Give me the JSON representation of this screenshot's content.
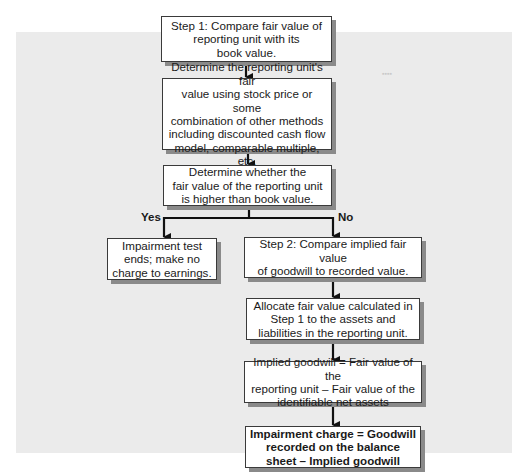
{
  "diagram": {
    "type": "flowchart",
    "nodes": {
      "step1": "Step 1: Compare fair value of\nreporting unit with its\nbook value.",
      "determine_fair_value": "Determine the reporting unit's fair\nvalue using stock price or some\ncombination of other methods\nincluding discounted cash flow\nmodel, comparable multiple, etc.",
      "decision": "Determine whether the\nfair value of the reporting unit\nis higher than book value.",
      "yes_outcome": "Impairment test\nends; make no\ncharge to earnings.",
      "step2": "Step 2: Compare implied fair value\nof goodwill to recorded value.",
      "allocate": "Allocate fair value calculated in\nStep 1 to the assets and\nliabilities in the reporting unit.",
      "implied_goodwill": "Implied goodwill = Fair value of the\nreporting unit – Fair value of the\nidentifiable net assets",
      "impairment_charge": "Impairment charge = Goodwill\nrecorded on the balance\nsheet – Implied goodwill"
    },
    "branch_labels": {
      "yes": "Yes",
      "no": "No"
    },
    "edges": [
      {
        "from": "step1",
        "to": "determine_fair_value"
      },
      {
        "from": "determine_fair_value",
        "to": "decision"
      },
      {
        "from": "decision",
        "to": "yes_outcome",
        "label": "Yes"
      },
      {
        "from": "decision",
        "to": "step2",
        "label": "No"
      },
      {
        "from": "step2",
        "to": "allocate"
      },
      {
        "from": "allocate",
        "to": "implied_goodwill"
      },
      {
        "from": "implied_goodwill",
        "to": "impairment_charge"
      }
    ]
  }
}
